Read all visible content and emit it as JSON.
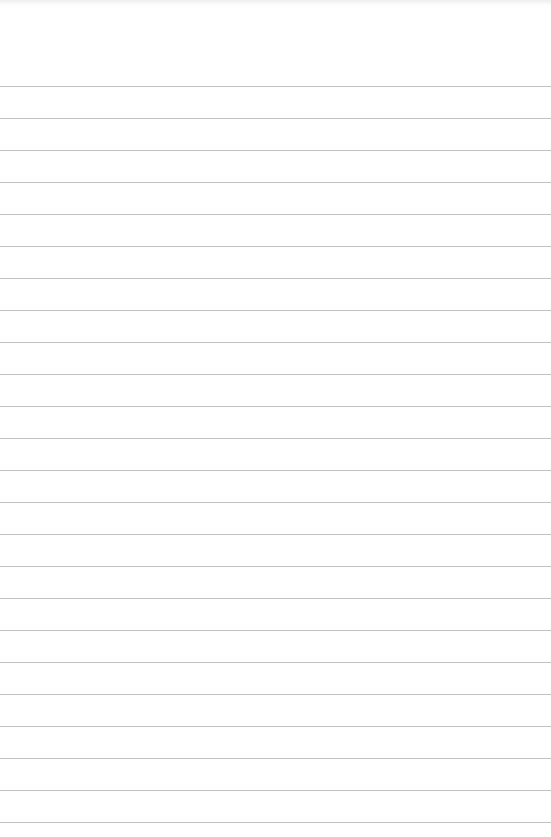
{
  "paper": {
    "type": "ruled-notebook-page",
    "background_color": "#ffffff",
    "rule_color": "#b9b9b9",
    "first_rule_y": 86,
    "rule_spacing": 32,
    "rule_count": 24,
    "text_content": ""
  }
}
